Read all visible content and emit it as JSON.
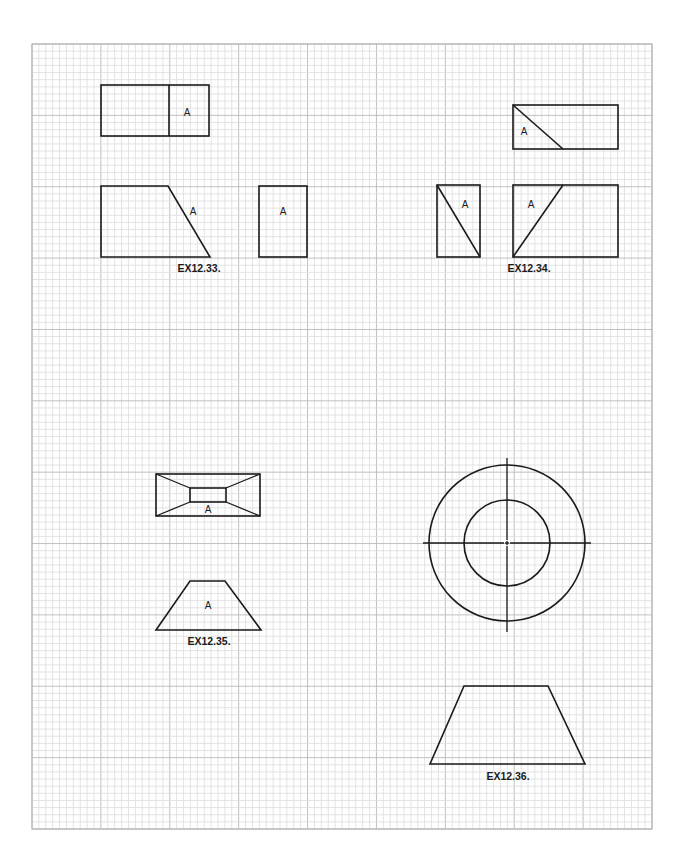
{
  "page": {
    "background_color": "#ffffff",
    "line_color": "#1a1a1a",
    "grid_minor_color": "#dcdcdc",
    "grid_major_color": "#b9b9b9",
    "grid": {
      "major_columns": 9,
      "major_rows": 11,
      "subdivisions": 10
    }
  },
  "exercises": [
    {
      "id": "ex12-33",
      "label": "EX12.33.",
      "views": [
        {
          "name": "top-view",
          "shape": "rectangle with vertical divider",
          "surface_label": "A"
        },
        {
          "name": "front-view",
          "shape": "trapezoid with inclined right edge",
          "surface_label": "A"
        },
        {
          "name": "side-view",
          "shape": "rectangle",
          "surface_label": "A"
        }
      ]
    },
    {
      "id": "ex12-34",
      "label": "EX12.34.",
      "views": [
        {
          "name": "top-view",
          "shape": "rectangle with diagonal",
          "surface_label": "A"
        },
        {
          "name": "side-view",
          "shape": "rectangle with diagonal",
          "surface_label": "A"
        },
        {
          "name": "front-view",
          "shape": "rectangle with diagonal",
          "surface_label": "A"
        }
      ]
    },
    {
      "id": "ex12-35",
      "label": "EX12.35.",
      "views": [
        {
          "name": "top-view",
          "shape": "frustum top view with inner rectangle",
          "surface_label": "A"
        },
        {
          "name": "front-view",
          "shape": "trapezoid",
          "surface_label": "A"
        }
      ]
    },
    {
      "id": "ex12-36",
      "label": "EX12.36.",
      "views": [
        {
          "name": "top-view",
          "shape": "concentric circles with centerlines",
          "surface_label": ""
        },
        {
          "name": "front-view",
          "shape": "trapezoid",
          "surface_label": ""
        }
      ]
    }
  ]
}
